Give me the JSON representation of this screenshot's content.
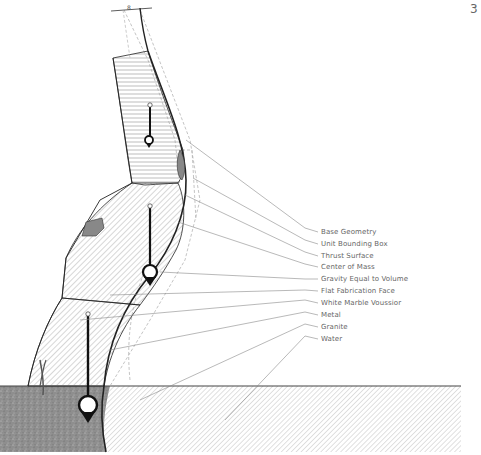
{
  "page": {
    "number": "3"
  },
  "legend": {
    "items": [
      {
        "label": "Base Geometry",
        "y": 232
      },
      {
        "label": "Unit Bounding Box",
        "y": 244
      },
      {
        "label": "Thrust Surface",
        "y": 256
      },
      {
        "label": "Center of Mass",
        "y": 267
      },
      {
        "label": "Gravity Equal to Volume",
        "y": 279
      },
      {
        "label": "Flat Fabrication Face",
        "y": 291
      },
      {
        "label": "White Marble Voussior",
        "y": 303
      },
      {
        "label": "Metal",
        "y": 315
      },
      {
        "label": "Granite",
        "y": 327
      },
      {
        "label": "Water",
        "y": 339
      }
    ]
  },
  "colors": {
    "line": "#222222",
    "leader": "#888888",
    "hatch": "#9a9a9a",
    "granite": "#8c8c8c",
    "metal": "#7a7a7a",
    "text": "#666666"
  }
}
